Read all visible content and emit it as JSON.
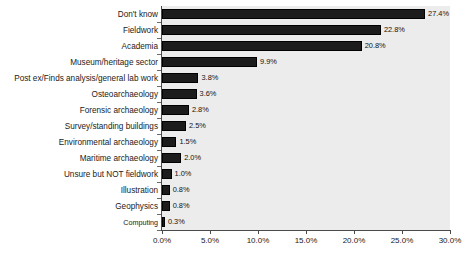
{
  "chart_data": {
    "type": "bar",
    "orientation": "horizontal",
    "title": "",
    "subtitle": "",
    "xlabel": "",
    "ylabel": "",
    "xlim": [
      0,
      30
    ],
    "grid": false,
    "legend": false,
    "legend_position": "none",
    "bar_color": "#1c1c1c",
    "plot_background": "#ececec",
    "page_background": "#ffffff",
    "axis_color": "#4a4a4a",
    "xticks": [
      "0.0%",
      "5.0%",
      "10.0%",
      "15.0%",
      "20.0%",
      "25.0%",
      "30.0%"
    ],
    "xtick_values": [
      0,
      5,
      10,
      15,
      20,
      25,
      30
    ],
    "categories": [
      "Don't know",
      "Fieldwork",
      "Academia",
      "Museum/heritage sector",
      "Post ex/Finds analysis/general lab work",
      "Osteoarchaeology",
      "Forensic archaeology",
      "Survey/standing buildings",
      "Environmental archaeology",
      "Maritime archaeology",
      "Unsure but NOT fieldwork",
      "Illustration",
      "Geophysics",
      "Computing"
    ],
    "values": [
      27.4,
      22.8,
      20.8,
      9.9,
      3.8,
      3.6,
      2.8,
      2.5,
      1.5,
      2.0,
      1.0,
      0.8,
      0.8,
      0.3
    ],
    "data_labels": [
      "27.4%",
      "22.8%",
      "20.8%",
      "9.9%",
      "3.8%",
      "3.6%",
      "2.8%",
      "2.5%",
      "1.5%",
      "2.0%",
      "1.0%",
      "0.8%",
      "0.8%",
      "0.3%"
    ]
  }
}
